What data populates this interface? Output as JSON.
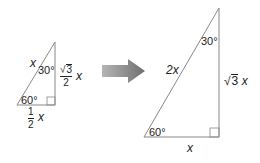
{
  "small_triangle": {
    "hypotenuse_label": "x",
    "top_angle": "30°",
    "bottom_angle": "60°",
    "vertical_side": {
      "radical": "√",
      "radicand": "3",
      "denominator": "2",
      "variable": "x"
    },
    "base_side": {
      "numerator": "1",
      "denominator": "2",
      "variable": "x"
    }
  },
  "big_triangle": {
    "hypotenuse_label": "2x",
    "top_angle": "30°",
    "bottom_angle": "60°",
    "vertical_side": {
      "radical": "√",
      "radicand": "3",
      "variable": "x"
    },
    "base_side": "x"
  },
  "arrow": {
    "direction": "right",
    "color": "#8a8a8a"
  },
  "colors": {
    "line": "#888888",
    "text": "#222222"
  }
}
